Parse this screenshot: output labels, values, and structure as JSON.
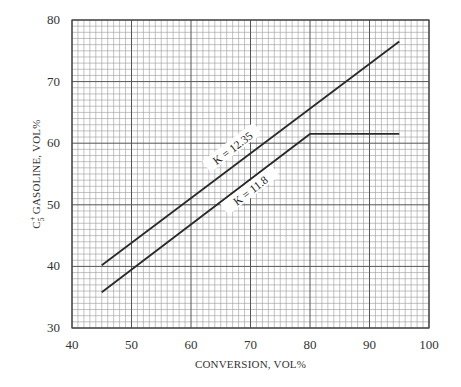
{
  "chart_data": {
    "type": "line",
    "title": "",
    "xlabel": "CONVERSION, VOL%",
    "ylabel": "C5+ GASOLINE, VOL%",
    "ylabel_parts": {
      "base": "C",
      "sup": "+",
      "sub": "5",
      "rest": " GASOLINE, VOL%"
    },
    "xlim": [
      40,
      100
    ],
    "ylim": [
      30,
      80
    ],
    "x_ticks": [
      40,
      50,
      60,
      70,
      80,
      90,
      100
    ],
    "y_ticks": [
      30,
      40,
      50,
      60,
      70,
      80
    ],
    "x_tick_labels": [
      "40",
      "50",
      "60",
      "70",
      "80",
      "90",
      "100"
    ],
    "y_tick_labels": [
      "30",
      "40",
      "50",
      "60",
      "70",
      "80"
    ],
    "grid": {
      "major": true,
      "minor": true,
      "minor_step_x": 1,
      "minor_step_y": 1
    },
    "legend": null,
    "series": [
      {
        "name": "K = 12.35",
        "x": [
          45,
          95
        ],
        "y": [
          40.2,
          76.5
        ],
        "label_position": {
          "x": 67,
          "y": 59.2
        }
      },
      {
        "name": "K = 11.8",
        "x": [
          45,
          80,
          95
        ],
        "y": [
          35.8,
          61.5,
          61.5
        ],
        "label_position": {
          "x": 70,
          "y": 52.3
        }
      }
    ],
    "annotations": [
      "K = 12.35",
      "K = 11.8"
    ]
  }
}
